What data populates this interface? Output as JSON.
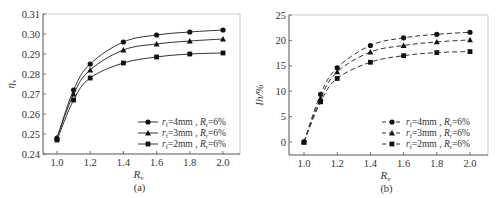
{
  "chart_data": [
    {
      "id": "a",
      "type": "line",
      "caption": "(a)",
      "title": "",
      "xlabel": "R_v",
      "ylabel": "η_v",
      "xlim": [
        0.9,
        2.1
      ],
      "ylim": [
        0.24,
        0.31
      ],
      "xticks": [
        1.0,
        1.2,
        1.4,
        1.6,
        1.8,
        2.0
      ],
      "xtick_labels": [
        "1.0",
        "1.2",
        "1.4",
        "1.6",
        "1.8",
        "2.0"
      ],
      "yticks": [
        0.24,
        0.25,
        0.26,
        0.27,
        0.28,
        0.29,
        0.3,
        0.31
      ],
      "ytick_labels": [
        "0.24",
        "0.25",
        "0.26",
        "0.27",
        "0.28",
        "0.29",
        "0.30",
        "0.31"
      ],
      "grid": false,
      "legend_position": "lower right",
      "line_style": "solid",
      "x": [
        1.0,
        1.1,
        1.2,
        1.4,
        1.6,
        1.8,
        2.0
      ],
      "series": [
        {
          "name": "r_f=4mm, R_r=6%",
          "marker": "circle",
          "values": [
            0.248,
            0.272,
            0.285,
            0.296,
            0.2995,
            0.301,
            0.302
          ]
        },
        {
          "name": "r_f=3mm, R_r=6%",
          "marker": "triangle",
          "values": [
            0.248,
            0.27,
            0.282,
            0.292,
            0.295,
            0.2965,
            0.2975
          ]
        },
        {
          "name": "r_f=2mm, R_r=6%",
          "marker": "square",
          "values": [
            0.247,
            0.267,
            0.278,
            0.2855,
            0.2885,
            0.29,
            0.2905
          ]
        }
      ]
    },
    {
      "id": "b",
      "type": "line",
      "caption": "(b)",
      "title": "",
      "xlabel": "R_v",
      "ylabel": "Ih/%",
      "xlim": [
        0.9,
        2.1
      ],
      "ylim": [
        -2.5,
        25
      ],
      "xticks": [
        1.0,
        1.2,
        1.4,
        1.6,
        1.8,
        2.0
      ],
      "xtick_labels": [
        "1.0",
        "1.2",
        "1.4",
        "1.6",
        "1.8",
        "2.0"
      ],
      "yticks": [
        0,
        5,
        10,
        15,
        20,
        25
      ],
      "ytick_labels": [
        "0",
        "5",
        "10",
        "15",
        "20",
        "25"
      ],
      "grid": false,
      "legend_position": "lower right",
      "line_style": "dashed",
      "x": [
        1.0,
        1.1,
        1.2,
        1.4,
        1.6,
        1.8,
        2.0
      ],
      "series": [
        {
          "name": "r_f=4mm, R_r=6%",
          "marker": "circle",
          "values": [
            0,
            9.4,
            14.6,
            19.0,
            20.5,
            21.2,
            21.6
          ]
        },
        {
          "name": "r_f=3mm, R_r=6%",
          "marker": "triangle",
          "values": [
            0,
            8.6,
            13.8,
            17.7,
            19.0,
            19.7,
            20.1
          ]
        },
        {
          "name": "r_f=2mm, R_r=6%",
          "marker": "square",
          "values": [
            0,
            7.9,
            12.5,
            15.7,
            17.0,
            17.6,
            17.8
          ]
        }
      ]
    }
  ],
  "legend_labels": {
    "rf4": "=4mm , R",
    "rf3": "=3mm , R",
    "rf2": "=2mm , R",
    "r": "r",
    "f": "f",
    "sub_r": "r",
    "pct": "=6%"
  },
  "axis_text": {
    "rv_main": "R",
    "rv_sub": "v",
    "eta_main": "η",
    "eta_sub": "v",
    "ih": "Ih/%"
  },
  "colors": {
    "line": "#333333",
    "axis": "#555555",
    "marker": "#111111"
  }
}
